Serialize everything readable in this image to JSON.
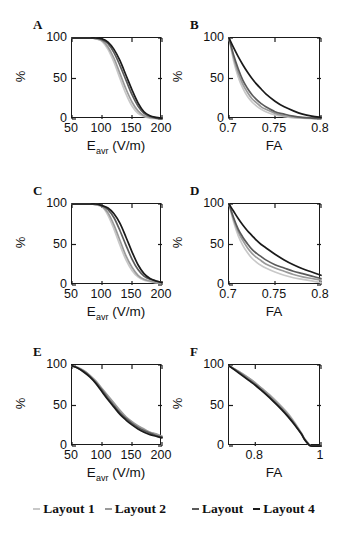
{
  "figure": {
    "panels": [
      {
        "letter": "A",
        "ylabel": "%",
        "yticks": [
          "0",
          "50",
          "100"
        ],
        "xticks": [
          "50",
          "100",
          "150",
          "200"
        ],
        "xlabel_main": "E",
        "xlabel_sub": "avr",
        "xlabel_unit": "(V/m)"
      },
      {
        "letter": "B",
        "ylabel": "%",
        "yticks": [
          "0",
          "50",
          "100"
        ],
        "xticks": [
          "0.7",
          "0.75",
          "0.8"
        ],
        "xlabel_main": "FA",
        "xlabel_sub": "",
        "xlabel_unit": ""
      },
      {
        "letter": "C",
        "ylabel": "%",
        "yticks": [
          "0",
          "50",
          "100"
        ],
        "xticks": [
          "50",
          "100",
          "150",
          "200"
        ],
        "xlabel_main": "E",
        "xlabel_sub": "avr",
        "xlabel_unit": "(V/m)"
      },
      {
        "letter": "D",
        "ylabel": "%",
        "yticks": [
          "0",
          "50",
          "100"
        ],
        "xticks": [
          "0.7",
          "0.75",
          "0.8"
        ],
        "xlabel_main": "FA",
        "xlabel_sub": "",
        "xlabel_unit": ""
      },
      {
        "letter": "E",
        "ylabel": "%",
        "yticks": [
          "0",
          "50",
          "100"
        ],
        "xticks": [
          "50",
          "100",
          "150",
          "200"
        ],
        "xlabel_main": "E",
        "xlabel_sub": "avr",
        "xlabel_unit": "(V/m)"
      },
      {
        "letter": "F",
        "ylabel": "%",
        "yticks": [
          "0",
          "50",
          "100"
        ],
        "xticks": [
          "0.8",
          "1"
        ],
        "xlabel_main": "FA",
        "xlabel_sub": "",
        "xlabel_unit": ""
      }
    ],
    "legend": {
      "items": [
        {
          "label": "Layout 1",
          "color": "#c8c8c8"
        },
        {
          "label": "Layout 2",
          "color": "#9a9a9a"
        },
        {
          "label": "Layout",
          "color": "#5a5a5a"
        },
        {
          "label": "Layout 4",
          "color": "#1a1a1a"
        }
      ]
    }
  },
  "chart_data": [
    {
      "id": "A",
      "type": "line",
      "title": "A",
      "xlabel": "E_avr (V/m)",
      "ylabel": "%",
      "xlim": [
        50,
        200
      ],
      "ylim": [
        0,
        100
      ],
      "xticks": [
        50,
        100,
        150,
        200
      ],
      "yticks": [
        0,
        50,
        100
      ],
      "grid": false,
      "legend_position": "below-figure",
      "x": [
        50,
        60,
        70,
        80,
        90,
        100,
        110,
        120,
        130,
        140,
        150,
        160,
        170,
        180,
        190,
        200
      ],
      "series": [
        {
          "name": "Layout 1",
          "color": "#c8c8c8",
          "values": [
            100,
            100,
            100,
            100,
            99,
            96,
            86,
            70,
            50,
            31,
            16,
            7,
            3,
            1,
            0.5,
            0
          ]
        },
        {
          "name": "Layout 2",
          "color": "#9a9a9a",
          "values": [
            100,
            100,
            100,
            100,
            99,
            97,
            89,
            75,
            56,
            37,
            21,
            10,
            4,
            2,
            1,
            0
          ]
        },
        {
          "name": "Layout",
          "color": "#5a5a5a",
          "values": [
            100,
            100,
            100,
            100,
            100,
            98,
            93,
            82,
            66,
            48,
            30,
            16,
            7,
            3,
            1,
            0
          ]
        },
        {
          "name": "Layout 4",
          "color": "#1a1a1a",
          "values": [
            100,
            100,
            100,
            100,
            100,
            99,
            95,
            86,
            72,
            54,
            36,
            20,
            9,
            4,
            2,
            1
          ]
        }
      ]
    },
    {
      "id": "B",
      "type": "line",
      "title": "B",
      "xlabel": "FA",
      "ylabel": "%",
      "xlim": [
        0.7,
        0.8
      ],
      "ylim": [
        0,
        100
      ],
      "xticks": [
        0.7,
        0.75,
        0.8
      ],
      "yticks": [
        0,
        50,
        100
      ],
      "grid": false,
      "legend_position": "below-figure",
      "x": [
        0.7,
        0.705,
        0.71,
        0.715,
        0.72,
        0.725,
        0.73,
        0.735,
        0.74,
        0.75,
        0.76,
        0.77,
        0.78,
        0.79,
        0.8
      ],
      "series": [
        {
          "name": "Layout 1",
          "color": "#c8c8c8",
          "values": [
            100,
            72,
            52,
            38,
            28,
            21,
            16,
            12,
            9,
            5,
            3,
            1.5,
            1,
            0.5,
            0
          ]
        },
        {
          "name": "Layout 2",
          "color": "#9a9a9a",
          "values": [
            100,
            76,
            57,
            43,
            33,
            25,
            20,
            15,
            12,
            7,
            4,
            2.5,
            1.5,
            1,
            0.5
          ]
        },
        {
          "name": "Layout",
          "color": "#5a5a5a",
          "values": [
            100,
            79,
            62,
            48,
            38,
            30,
            24,
            19,
            15,
            9,
            6,
            3.5,
            2,
            1.2,
            0.7
          ]
        },
        {
          "name": "Layout 4",
          "color": "#1a1a1a",
          "values": [
            100,
            88,
            77,
            67,
            58,
            50,
            43,
            37,
            31,
            22,
            15,
            10,
            6,
            3.5,
            2
          ]
        }
      ]
    },
    {
      "id": "C",
      "type": "line",
      "title": "C",
      "xlabel": "E_avr (V/m)",
      "ylabel": "%",
      "xlim": [
        50,
        200
      ],
      "ylim": [
        0,
        100
      ],
      "xticks": [
        50,
        100,
        150,
        200
      ],
      "yticks": [
        0,
        50,
        100
      ],
      "grid": false,
      "legend_position": "below-figure",
      "x": [
        50,
        60,
        70,
        80,
        90,
        100,
        110,
        120,
        130,
        140,
        150,
        160,
        170,
        180,
        190,
        200
      ],
      "series": [
        {
          "name": "Layout 1",
          "color": "#c8c8c8",
          "values": [
            100,
            100,
            100,
            100,
            99,
            97,
            86,
            69,
            49,
            31,
            18,
            10,
            6,
            4,
            3,
            2
          ]
        },
        {
          "name": "Layout 2",
          "color": "#9a9a9a",
          "values": [
            100,
            100,
            100,
            100,
            99,
            97,
            89,
            74,
            55,
            36,
            22,
            12,
            7,
            5,
            3,
            2
          ]
        },
        {
          "name": "Layout",
          "color": "#5a5a5a",
          "values": [
            100,
            100,
            100,
            100,
            100,
            98,
            93,
            83,
            67,
            49,
            32,
            19,
            11,
            7,
            5,
            3
          ]
        },
        {
          "name": "Layout 4",
          "color": "#1a1a1a",
          "values": [
            100,
            100,
            100,
            100,
            100,
            98,
            95,
            88,
            76,
            59,
            41,
            25,
            14,
            8,
            5,
            3
          ]
        }
      ]
    },
    {
      "id": "D",
      "type": "line",
      "title": "D",
      "xlabel": "FA",
      "ylabel": "%",
      "xlim": [
        0.7,
        0.8
      ],
      "ylim": [
        0,
        100
      ],
      "xticks": [
        0.7,
        0.75,
        0.8
      ],
      "yticks": [
        0,
        50,
        100
      ],
      "grid": false,
      "legend_position": "below-figure",
      "x": [
        0.7,
        0.705,
        0.71,
        0.715,
        0.72,
        0.725,
        0.73,
        0.735,
        0.74,
        0.75,
        0.76,
        0.77,
        0.78,
        0.79,
        0.8
      ],
      "series": [
        {
          "name": "Layout 1",
          "color": "#c8c8c8",
          "values": [
            100,
            78,
            61,
            49,
            40,
            33,
            28,
            24,
            21,
            16,
            12,
            9,
            7,
            5,
            3
          ]
        },
        {
          "name": "Layout 2",
          "color": "#9a9a9a",
          "values": [
            100,
            81,
            66,
            55,
            46,
            39,
            34,
            30,
            26,
            21,
            17,
            13,
            10,
            8,
            6
          ]
        },
        {
          "name": "Layout",
          "color": "#5a5a5a",
          "values": [
            100,
            83,
            69,
            59,
            51,
            44,
            39,
            35,
            31,
            25,
            21,
            17,
            14,
            11,
            8
          ]
        },
        {
          "name": "Layout 4",
          "color": "#1a1a1a",
          "values": [
            100,
            91,
            82,
            74,
            67,
            61,
            55,
            50,
            46,
            38,
            31,
            25,
            20,
            16,
            12
          ]
        }
      ]
    },
    {
      "id": "E",
      "type": "line",
      "title": "E",
      "xlabel": "E_avr (V/m)",
      "ylabel": "%",
      "xlim": [
        50,
        200
      ],
      "ylim": [
        0,
        100
      ],
      "xticks": [
        50,
        100,
        150,
        200
      ],
      "yticks": [
        0,
        50,
        100
      ],
      "grid": false,
      "legend_position": "below-figure",
      "x": [
        50,
        60,
        70,
        80,
        90,
        100,
        110,
        120,
        130,
        140,
        150,
        160,
        170,
        180,
        190,
        200
      ],
      "series": [
        {
          "name": "Layout 1",
          "color": "#c8c8c8",
          "values": [
            99,
            97,
            93,
            87,
            79,
            70,
            61,
            52,
            43,
            35,
            29,
            24,
            20,
            17,
            14,
            12
          ]
        },
        {
          "name": "Layout 2",
          "color": "#9a9a9a",
          "values": [
            99,
            97,
            93,
            87,
            80,
            71,
            62,
            53,
            44,
            36,
            30,
            25,
            21,
            17,
            15,
            12
          ]
        },
        {
          "name": "Layout",
          "color": "#5a5a5a",
          "values": [
            99,
            96,
            92,
            86,
            78,
            69,
            59,
            50,
            41,
            34,
            28,
            23,
            19,
            16,
            13,
            11
          ]
        },
        {
          "name": "Layout 4",
          "color": "#1a1a1a",
          "values": [
            99,
            96,
            91,
            85,
            77,
            67,
            57,
            48,
            39,
            32,
            26,
            21,
            17,
            14,
            12,
            10
          ]
        }
      ]
    },
    {
      "id": "F",
      "type": "line",
      "title": "F",
      "xlabel": "FA",
      "ylabel": "%",
      "xlim": [
        0.72,
        1.0
      ],
      "ylim": [
        0,
        100
      ],
      "xticks": [
        0.8,
        1
      ],
      "yticks": [
        0,
        50,
        100
      ],
      "grid": false,
      "legend_position": "below-figure",
      "x": [
        0.72,
        0.75,
        0.78,
        0.8,
        0.82,
        0.85,
        0.88,
        0.9,
        0.92,
        0.94,
        0.95,
        0.96,
        0.97,
        1.0
      ],
      "series": [
        {
          "name": "Layout 1",
          "color": "#c8c8c8",
          "values": [
            99,
            92,
            84,
            78,
            71,
            61,
            49,
            40,
            29,
            16,
            9,
            4,
            0,
            0
          ]
        },
        {
          "name": "Layout 2",
          "color": "#9a9a9a",
          "values": [
            99,
            92,
            84,
            78,
            71,
            60,
            48,
            39,
            28,
            16,
            9,
            4,
            0,
            0
          ]
        },
        {
          "name": "Layout",
          "color": "#5a5a5a",
          "values": [
            99,
            91,
            82,
            76,
            69,
            58,
            46,
            37,
            27,
            15,
            8,
            3,
            0,
            0
          ]
        },
        {
          "name": "Layout 4",
          "color": "#1a1a1a",
          "values": [
            99,
            90,
            81,
            75,
            68,
            57,
            45,
            36,
            26,
            15,
            8,
            3,
            0,
            0
          ]
        }
      ]
    }
  ]
}
